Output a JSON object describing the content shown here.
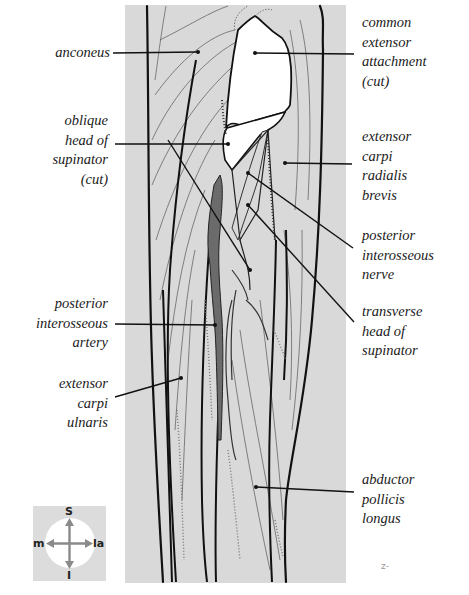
{
  "figure": {
    "colors": {
      "background_panel": "#d9d9d9",
      "outline": "#111111",
      "muscle_fiber": "#555555",
      "artery_fill": "#6b6b6b",
      "nerve_fill": "#d8d8d8",
      "label_text": "#1a1a1a",
      "leader_line": "#111111"
    }
  },
  "labels": {
    "left": [
      {
        "id": "anconeus",
        "text": "anconeus"
      },
      {
        "id": "oblique_head_supinator",
        "text": "oblique\nhead of\nsupinator\n(cut)"
      },
      {
        "id": "posterior_interosseous_artery",
        "text": "posterior\ninterosseous\nartery"
      },
      {
        "id": "extensor_carpi_ulnaris",
        "text": "extensor\ncarpi\nulnaris"
      }
    ],
    "right": [
      {
        "id": "common_extensor_attachment",
        "text": "common\nextensor\nattachment\n(cut)"
      },
      {
        "id": "extensor_carpi_radialis_brevis",
        "text": "extensor\ncarpi\nradialis\nbrevis"
      },
      {
        "id": "posterior_interosseous_nerve",
        "text": "posterior\ninterosseous\nnerve"
      },
      {
        "id": "transverse_head_supinator",
        "text": "transverse\nhead of\nsupinator"
      },
      {
        "id": "abductor_pollicis_longus",
        "text": "abductor\npollicis\nlongus"
      }
    ]
  },
  "compass": {
    "superior": "S",
    "inferior": "I",
    "medial": "m",
    "lateral": "la"
  },
  "artist_mark": "z-"
}
